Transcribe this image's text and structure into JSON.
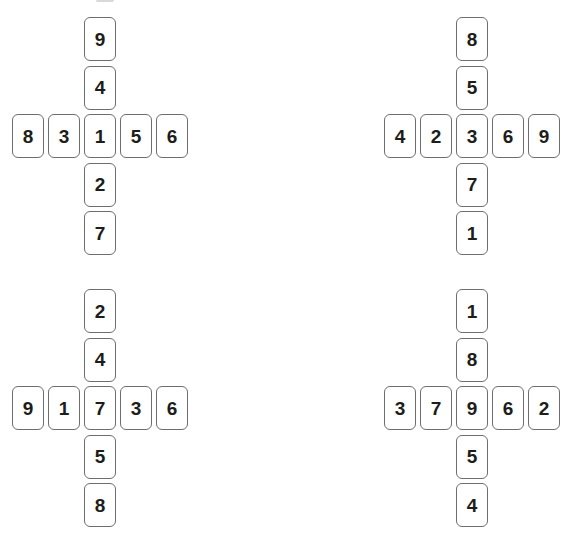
{
  "page": {
    "background": "#ffffff",
    "card_border_color": "#6e6e6e",
    "card_digit_color": "#1d1d1b",
    "artifact_color": "#d9d9d9"
  },
  "puzzles": [
    {
      "id": "top-left",
      "vertical": [
        "9",
        "4",
        "1",
        "2",
        "7"
      ],
      "horizontal": [
        "8",
        "3",
        "1",
        "5",
        "6"
      ],
      "center": "1"
    },
    {
      "id": "top-right",
      "vertical": [
        "8",
        "5",
        "3",
        "7",
        "1"
      ],
      "horizontal": [
        "4",
        "2",
        "3",
        "6",
        "9"
      ],
      "center": "3"
    },
    {
      "id": "bottom-left",
      "vertical": [
        "2",
        "4",
        "7",
        "5",
        "8"
      ],
      "horizontal": [
        "9",
        "1",
        "7",
        "3",
        "6"
      ],
      "center": "7"
    },
    {
      "id": "bottom-right",
      "vertical": [
        "1",
        "8",
        "9",
        "5",
        "4"
      ],
      "horizontal": [
        "3",
        "7",
        "9",
        "6",
        "2"
      ],
      "center": "9"
    }
  ]
}
